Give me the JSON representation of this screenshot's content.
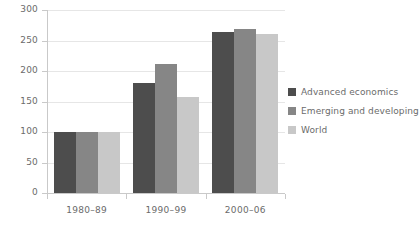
{
  "chart_data": {
    "type": "bar",
    "title": "",
    "subtitle": "",
    "xlabel": "",
    "ylabel": "",
    "categories": [
      "1980–89",
      "1990–99",
      "2000–06"
    ],
    "series": [
      {
        "name": "Advanced economics",
        "values": [
          100,
          180,
          264
        ],
        "color": "#4d4d4d"
      },
      {
        "name": "Emerging and developing",
        "values": [
          100,
          211,
          269
        ],
        "color": "#868686"
      },
      {
        "name": "World",
        "values": [
          100,
          157,
          261
        ],
        "color": "#c8c8c8"
      }
    ],
    "ylim": [
      0,
      300
    ],
    "ytick_labels": [
      "0",
      "50",
      "100",
      "150",
      "200",
      "250",
      "300"
    ],
    "ytick_values": [
      0,
      50,
      100,
      150,
      200,
      250,
      300
    ],
    "grid": true,
    "grid_axis": "y",
    "legend_position": "right",
    "axis_color": "#c9c9c9",
    "grid_color": "#e6e6e6",
    "text_color": "#6b6b6b",
    "background": "#ffffff"
  }
}
